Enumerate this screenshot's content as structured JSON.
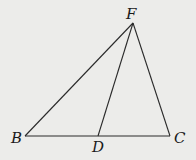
{
  "diagram": {
    "type": "triangle",
    "background": "#ececea",
    "line_color": "#2a2a2a",
    "points": {
      "F": {
        "label": "F",
        "x": 133,
        "y": 23
      },
      "B": {
        "label": "B",
        "x": 25,
        "y": 136
      },
      "C": {
        "label": "C",
        "x": 170,
        "y": 136
      },
      "D": {
        "label": "D",
        "x": 98,
        "y": 136
      }
    },
    "segments": [
      "FB",
      "FC",
      "BC",
      "FD"
    ]
  }
}
